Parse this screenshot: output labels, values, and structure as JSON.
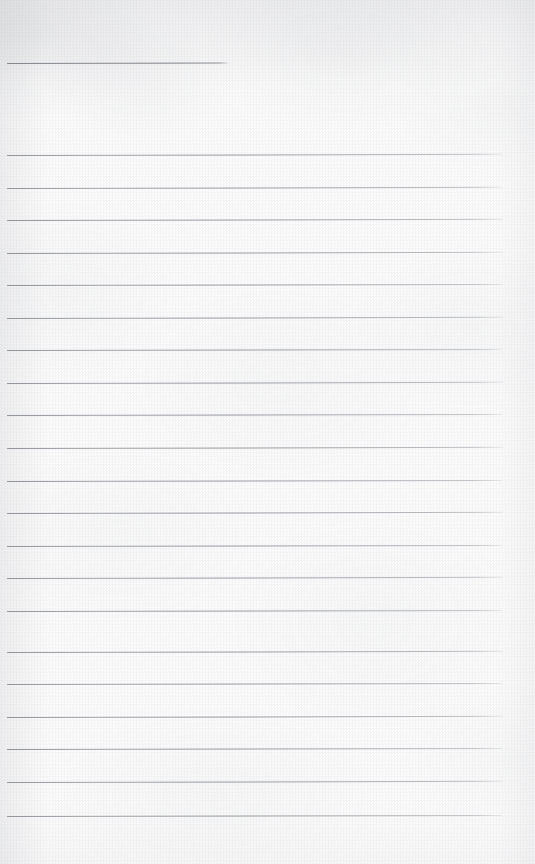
{
  "page": {
    "kind": "scanned-lined-paper",
    "width": 535,
    "height": 864,
    "background_color": "#fdfdfd",
    "rule_color": "#8e9098",
    "text_content": "",
    "note": "Blank scanned ruled notepad page — no text, no handwriting, no headings, no page numbers"
  },
  "rules": {
    "header_rule": {
      "name": "header-rule",
      "y": 63,
      "x_start": 7,
      "x_end": 228,
      "width": 221,
      "thickness": 1,
      "skew_deg": -0.12
    },
    "body_rules": [
      {
        "y": 155,
        "x_start": 7,
        "x_end": 502,
        "skew_deg": -0.14
      },
      {
        "y": 188,
        "x_start": 7,
        "x_end": 502,
        "skew_deg": -0.14
      },
      {
        "y": 220,
        "x_start": 7,
        "x_end": 503,
        "skew_deg": -0.13
      },
      {
        "y": 253,
        "x_start": 7,
        "x_end": 502,
        "skew_deg": -0.14
      },
      {
        "y": 285,
        "x_start": 7,
        "x_end": 502,
        "skew_deg": -0.13
      },
      {
        "y": 318,
        "x_start": 7,
        "x_end": 503,
        "skew_deg": -0.14
      },
      {
        "y": 350,
        "x_start": 7,
        "x_end": 502,
        "skew_deg": -0.13
      },
      {
        "y": 383,
        "x_start": 7,
        "x_end": 503,
        "skew_deg": -0.14
      },
      {
        "y": 415,
        "x_start": 7,
        "x_end": 502,
        "skew_deg": -0.13
      },
      {
        "y": 448,
        "x_start": 7,
        "x_end": 503,
        "skew_deg": -0.14
      },
      {
        "y": 481,
        "x_start": 7,
        "x_end": 502,
        "skew_deg": -0.13
      },
      {
        "y": 513,
        "x_start": 7,
        "x_end": 503,
        "skew_deg": -0.14
      },
      {
        "y": 546,
        "x_start": 7,
        "x_end": 502,
        "skew_deg": -0.13
      },
      {
        "y": 578,
        "x_start": 7,
        "x_end": 503,
        "skew_deg": -0.14
      },
      {
        "y": 611,
        "x_start": 7,
        "x_end": 502,
        "skew_deg": -0.13
      },
      {
        "y": 652,
        "x_start": 7,
        "x_end": 503,
        "skew_deg": -0.14
      },
      {
        "y": 684,
        "x_start": 7,
        "x_end": 502,
        "skew_deg": -0.13
      },
      {
        "y": 717,
        "x_start": 7,
        "x_end": 503,
        "skew_deg": -0.14
      },
      {
        "y": 749,
        "x_start": 7,
        "x_end": 502,
        "skew_deg": -0.13
      },
      {
        "y": 782,
        "x_start": 7,
        "x_end": 503,
        "skew_deg": -0.14
      },
      {
        "y": 816,
        "x_start": 7,
        "x_end": 502,
        "skew_deg": -0.13
      }
    ]
  },
  "margins": {
    "top_blank_px": 55,
    "bottom_blank_px": 48,
    "left_blank_px": 7,
    "right_blank_px": 32
  }
}
